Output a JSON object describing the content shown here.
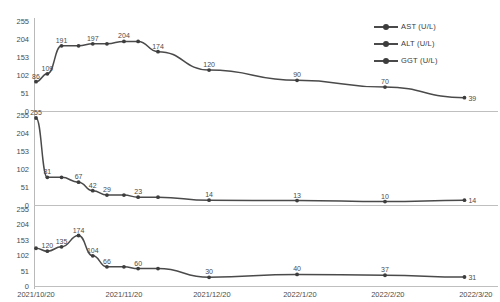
{
  "legend": {
    "items": [
      {
        "label": "AST  (U/L)",
        "color": "#3d3d3d",
        "marker": "line-marker-icon"
      },
      {
        "label": "ALT  (U/L)",
        "color": "#3d3d3d",
        "marker": "line-marker-icon"
      },
      {
        "label": "GGT  (U/L)",
        "color": "#3d3d3d",
        "marker": "line-marker-icon"
      }
    ]
  },
  "axis": {
    "yticks": [
      "0",
      "51",
      "102",
      "153",
      "204",
      "255"
    ],
    "ylim": [
      0,
      255
    ],
    "xticks": [
      "2021/10/20",
      "2021/11/20",
      "2021/12/20",
      "2022/1/20",
      "2022/2/20",
      "2022/3/20"
    ]
  },
  "chart_data": [
    {
      "type": "line",
      "title": "",
      "name": "AST  (U/L)",
      "xlabel": "",
      "ylabel": "",
      "ylim": [
        0,
        255
      ],
      "grid": false,
      "legend_position": "top-right",
      "categories": [
        "2021/10/20",
        "2021/10/24",
        "2021/10/29",
        "2021/11/04",
        "2021/11/09",
        "2021/11/14",
        "2021/11/20",
        "2021/11/25",
        "2021/12/02",
        "2021/12/20",
        "2022/1/20",
        "2022/2/20",
        "2022/3/20"
      ],
      "x": [
        0,
        4,
        9,
        15,
        20,
        25,
        31,
        36,
        43,
        61,
        92,
        123,
        151
      ],
      "values": [
        86,
        109,
        191,
        191,
        197,
        197,
        204,
        204,
        174,
        120,
        90,
        70,
        39
      ],
      "labels": [
        "86",
        "109",
        "191",
        "",
        "197",
        "",
        "204",
        "",
        "174",
        "120",
        "90",
        "70",
        "39"
      ]
    },
    {
      "type": "line",
      "title": "",
      "name": "ALT  (U/L)",
      "xlabel": "",
      "ylabel": "",
      "ylim": [
        0,
        255
      ],
      "grid": false,
      "legend_position": "top-right",
      "categories": [
        "2021/10/20",
        "2021/10/24",
        "2021/10/29",
        "2021/11/04",
        "2021/11/09",
        "2021/11/14",
        "2021/11/20",
        "2021/11/25",
        "2021/12/02",
        "2021/12/20",
        "2022/1/20",
        "2022/2/20",
        "2022/3/20"
      ],
      "x": [
        0,
        4,
        9,
        15,
        20,
        25,
        31,
        36,
        43,
        61,
        92,
        123,
        151
      ],
      "values": [
        255,
        81,
        81,
        67,
        42,
        29,
        29,
        23,
        23,
        14,
        13,
        10,
        14
      ],
      "labels": [
        "255",
        "81",
        "",
        "67",
        "42",
        "29",
        "",
        "23",
        "",
        "14",
        "13",
        "10",
        "14"
      ]
    },
    {
      "type": "line",
      "title": "",
      "name": "GGT  (U/L)",
      "xlabel": "",
      "ylabel": "",
      "ylim": [
        0,
        255
      ],
      "grid": false,
      "legend_position": "top-right",
      "categories": [
        "2021/10/20",
        "2021/10/24",
        "2021/10/29",
        "2021/11/04",
        "2021/11/09",
        "2021/11/14",
        "2021/11/20",
        "2021/11/25",
        "2021/12/02",
        "2021/12/20",
        "2022/1/20",
        "2022/2/20",
        "2022/3/20"
      ],
      "x": [
        0,
        4,
        9,
        15,
        20,
        25,
        31,
        36,
        43,
        61,
        92,
        123,
        151
      ],
      "values": [
        130,
        120,
        135,
        174,
        104,
        66,
        66,
        60,
        60,
        30,
        40,
        37,
        31
      ],
      "labels": [
        "",
        "120",
        "135",
        "174",
        "104",
        "66",
        "",
        "60",
        "",
        "30",
        "40",
        "37",
        "31"
      ]
    }
  ]
}
